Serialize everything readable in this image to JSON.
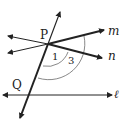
{
  "diagram": {
    "type": "geometry-lines-transversal",
    "points": {
      "P": "P",
      "Q": "Q"
    },
    "lines": {
      "m": "m",
      "n": "n",
      "l": "ℓ"
    },
    "angles": {
      "a1": "1",
      "a3": "3"
    },
    "colors": {
      "stroke": "#222222",
      "arc": "#555555",
      "background": "#ffffff"
    }
  }
}
